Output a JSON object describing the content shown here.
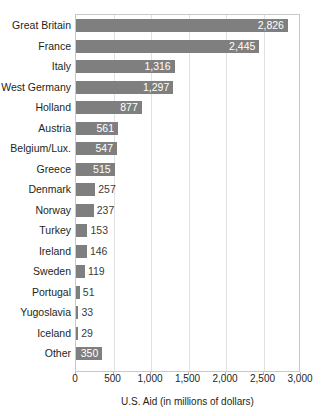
{
  "chart_data": {
    "type": "bar",
    "orientation": "horizontal",
    "title": "The Marshall Plan",
    "xlabel": "U.S. Aid (in millions of dollars)",
    "ylabel": "",
    "xlim": [
      0,
      3000
    ],
    "xticks": [
      "0",
      "500",
      "1,000",
      "1,500",
      "2,000",
      "2,500",
      "3,000"
    ],
    "xtick_values": [
      0,
      500,
      1000,
      1500,
      2000,
      2500,
      3000
    ],
    "grid": "vertical",
    "legend": "none",
    "categories": [
      "Great Britain",
      "France",
      "Italy",
      "West Germany",
      "Holland",
      "Austria",
      "Belgium/Lux.",
      "Greece",
      "Denmark",
      "Norway",
      "Turkey",
      "Ireland",
      "Sweden",
      "Portugal",
      "Yugoslavia",
      "Iceland",
      "Other"
    ],
    "values": [
      2826,
      2445,
      1316,
      1297,
      877,
      561,
      547,
      515,
      257,
      237,
      153,
      146,
      119,
      51,
      33,
      29,
      350
    ],
    "value_labels": [
      "2,826",
      "2,445",
      "1,316",
      "1,297",
      "877",
      "561",
      "547",
      "515",
      "257",
      "237",
      "153",
      "146",
      "119",
      "51",
      "33",
      "29",
      "350"
    ],
    "label_placement": [
      "inside",
      "inside",
      "inside",
      "inside",
      "inside",
      "inside",
      "inside",
      "inside",
      "outside",
      "outside",
      "outside",
      "outside",
      "outside",
      "outside",
      "outside",
      "outside",
      "inside"
    ],
    "colors": {
      "bar": "#7f7f7f",
      "inside_label": "#ffffff",
      "outside_label": "#3b3b3b",
      "gridline": "#e2e2e2",
      "plot_border": "#c9c9c9",
      "text": "#231f20",
      "background": "#ffffff"
    }
  }
}
